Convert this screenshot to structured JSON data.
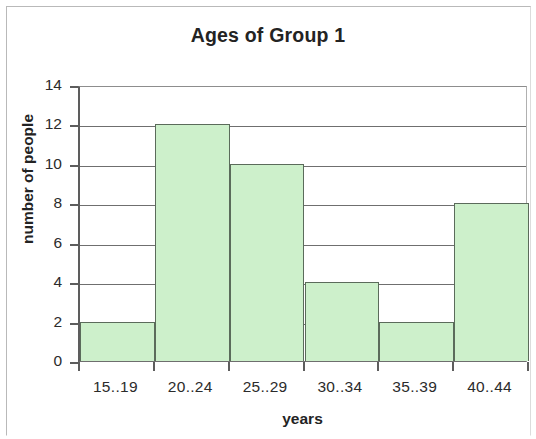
{
  "chart_data": {
    "type": "bar",
    "title": "Ages of Group 1",
    "xlabel": "years",
    "ylabel": "number of people",
    "categories": [
      "15..19",
      "20..24",
      "25..29",
      "30..34",
      "35..39",
      "40..44"
    ],
    "values": [
      2,
      12,
      10,
      4,
      2,
      8
    ],
    "ylim": [
      0,
      14
    ],
    "yticks": [
      0,
      2,
      4,
      6,
      8,
      10,
      12,
      14
    ],
    "ytick_labels": [
      "0",
      "2",
      "4",
      "6",
      "8",
      "10",
      "12",
      "14"
    ],
    "grid": "horizontal",
    "legend": "none",
    "series": [
      {
        "name": "number of people",
        "values": [
          2,
          12,
          10,
          4,
          2,
          8
        ]
      }
    ],
    "colors": {
      "bar_fill": "#cdf0cb",
      "bar_border": "#5b6b5b",
      "gridline": "#6f6f6f",
      "axis": "#5d5d5d",
      "text": "#232323",
      "background": "#ffffff",
      "frame": "#b9b9b9"
    }
  }
}
